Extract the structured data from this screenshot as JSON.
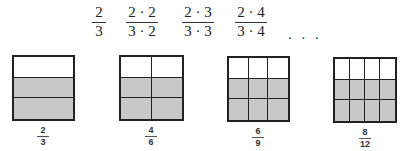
{
  "top_row": {
    "fractions": [
      {
        "numerator": "2",
        "denominator": "3"
      },
      {
        "numerator": "2 · 2",
        "denominator": "3 · 2"
      },
      {
        "numerator": "2 · 3",
        "denominator": "3 · 3"
      },
      {
        "numerator": "2 · 4",
        "denominator": "3 · 4"
      }
    ],
    "ellipsis": ". . ."
  },
  "models": [
    {
      "columns": 1,
      "rows": 3,
      "shaded_rows": 2,
      "label_numerator": "2",
      "label_denominator": "3"
    },
    {
      "columns": 2,
      "rows": 3,
      "shaded_rows": 2,
      "label_numerator": "4",
      "label_denominator": "6"
    },
    {
      "columns": 3,
      "rows": 3,
      "shaded_rows": 2,
      "label_numerator": "6",
      "label_denominator": "9"
    },
    {
      "columns": 4,
      "rows": 3,
      "shaded_rows": 2,
      "label_numerator": "8",
      "label_denominator": "12"
    }
  ],
  "colors": {
    "shade": "#c8c8c8",
    "line": "#222222"
  }
}
